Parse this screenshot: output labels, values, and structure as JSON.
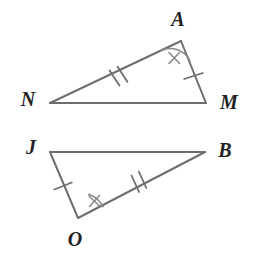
{
  "figure": {
    "background_color": "#ffffff",
    "stroke_color": "#6e6e6e",
    "label_color": "#232323",
    "mark_color": "#8a8a8a"
  },
  "triangles": [
    {
      "name": "triangle-NAM",
      "vertices": [
        {
          "id": "N",
          "label": "N",
          "x": 50,
          "y": 103,
          "label_x": 28,
          "label_y": 101
        },
        {
          "id": "A",
          "label": "A",
          "x": 181,
          "y": 41,
          "label_x": 178,
          "label_y": 21
        },
        {
          "id": "M",
          "label": "M",
          "x": 206,
          "y": 103,
          "label_x": 229,
          "label_y": 104
        }
      ],
      "sides": [
        {
          "id": "NA",
          "from": "N",
          "to": "A",
          "ticks": 2
        },
        {
          "id": "AM",
          "from": "A",
          "to": "M",
          "ticks": 1
        },
        {
          "id": "MN",
          "from": "M",
          "to": "N",
          "ticks": 0
        }
      ],
      "angles": [
        {
          "at": "A",
          "marks": 1,
          "arc_radius": 22
        }
      ]
    },
    {
      "name": "triangle-JOB",
      "vertices": [
        {
          "id": "J",
          "label": "J",
          "x": 50,
          "y": 152,
          "label_x": 31,
          "label_y": 149
        },
        {
          "id": "B",
          "label": "B",
          "x": 205,
          "y": 152,
          "label_x": 225,
          "label_y": 152
        },
        {
          "id": "O",
          "label": "O",
          "x": 78,
          "y": 218,
          "label_x": 75,
          "label_y": 241
        }
      ],
      "sides": [
        {
          "id": "JB",
          "from": "J",
          "to": "B",
          "ticks": 0
        },
        {
          "id": "JO",
          "from": "J",
          "to": "O",
          "ticks": 1
        },
        {
          "id": "OB",
          "from": "O",
          "to": "B",
          "ticks": 2
        }
      ],
      "angles": [
        {
          "at": "O",
          "marks": 1,
          "arc_radius": 26
        }
      ]
    }
  ],
  "labels": {
    "N": "N",
    "A": "A",
    "M": "M",
    "J": "J",
    "B": "B",
    "O": "O"
  }
}
